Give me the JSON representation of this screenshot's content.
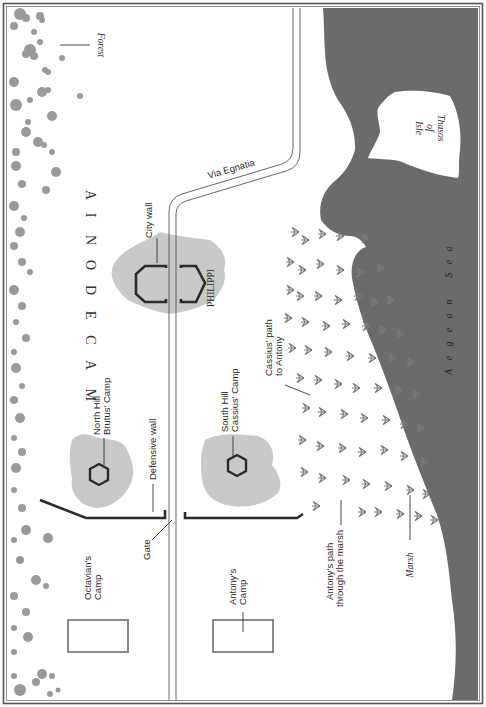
{
  "map": {
    "region_label": "MACEDONIA",
    "region_letters": [
      "M",
      "A",
      "C",
      "E",
      "D",
      "O",
      "N",
      "I",
      "A"
    ],
    "forest_label": "Forest",
    "road_label": "Via Egnatia",
    "city_label": "PHILIPPI",
    "city_wall_label": "City wall",
    "north_hill_label_line1": "North Hill",
    "north_hill_label_line2": "Brutus' Camp",
    "south_hill_label_line1": "South Hill",
    "south_hill_label_line2": "Cassius' Camp",
    "defensive_wall_label": "Defensive wall",
    "gate_label": "Gate",
    "octavian_camp_line1": "Octavian's",
    "octavian_camp_line2": "Camp",
    "antony_camp_line1": "Antony's",
    "antony_camp_line2": "Camp",
    "cassius_path_line1": "Cassius' path",
    "cassius_path_line2": "to Antony",
    "antony_path_line1": "Antony's path",
    "antony_path_line2": "through the marsh",
    "marsh_label": "Marsh",
    "sea_label": "Aegean Sea",
    "sea_letters": [
      "A",
      "e",
      "g",
      "e",
      "a",
      "n",
      " ",
      "S",
      "e",
      "a"
    ],
    "island_line1": "Isle",
    "island_line2": "of",
    "island_line3": "Thasos"
  },
  "colors": {
    "sea": "#6b6b6b",
    "hill": "#c9c9c9",
    "forest": "#9a9a9a",
    "camp_box": "#8a8a8a",
    "wall": "#2b2b2b",
    "frame": "#555555"
  }
}
